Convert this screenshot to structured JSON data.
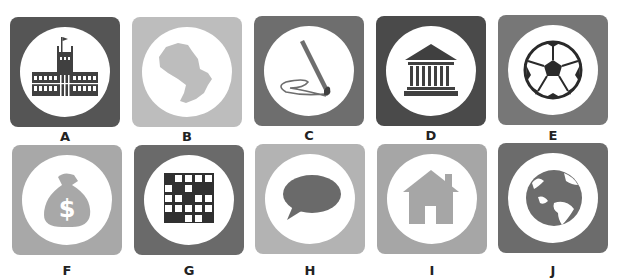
{
  "tiles": [
    {
      "label": "A",
      "icon": "government-palace-icon",
      "bg": "#555555"
    },
    {
      "label": "B",
      "icon": "country-map-icon",
      "bg": "#bdbdbd"
    },
    {
      "label": "C",
      "icon": "paintbrush-signature-icon",
      "bg": "#6e6e6e"
    },
    {
      "label": "D",
      "icon": "museum-building-icon",
      "bg": "#4a4a4a"
    },
    {
      "label": "E",
      "icon": "soccer-ball-icon",
      "bg": "#777777"
    },
    {
      "label": "F",
      "icon": "money-bag-icon",
      "bg": "#a8a8a8"
    },
    {
      "label": "G",
      "icon": "crossword-grid-icon",
      "bg": "#6a6a6a"
    },
    {
      "label": "H",
      "icon": "speech-bubble-icon",
      "bg": "#b3b3b3"
    },
    {
      "label": "I",
      "icon": "house-icon",
      "bg": "#a6a6a6"
    },
    {
      "label": "J",
      "icon": "globe-icon",
      "bg": "#6c6c6c"
    }
  ],
  "colors": {
    "icon_dark": "#404040",
    "icon_mid": "#6a6a6a",
    "icon_light": "#b0b0b0",
    "circle": "#ffffff"
  }
}
